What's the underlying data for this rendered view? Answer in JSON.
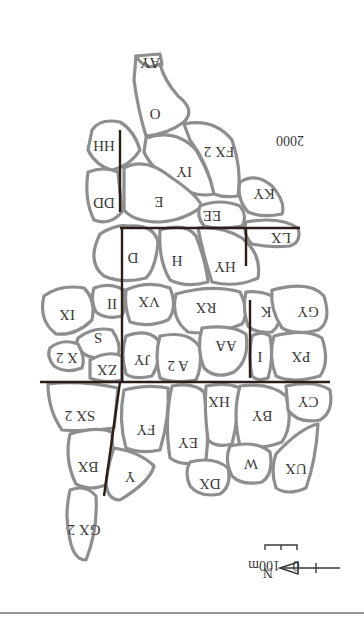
{
  "figure": {
    "orientation": "rotated-180",
    "year_label": "2000",
    "scale_bar": {
      "zero": "0",
      "distance": "100m"
    },
    "north_label": "N",
    "colors": {
      "parcel_stroke": "#8e8e8e",
      "road": "#2a1d1a",
      "text": "#3a3a3a",
      "background": "#ffffff"
    }
  },
  "parcels": [
    {
      "id": "AY",
      "label": "AY"
    },
    {
      "id": "O",
      "label": "O"
    },
    {
      "id": "HH",
      "label": "HH"
    },
    {
      "id": "IY",
      "label": "IY"
    },
    {
      "id": "FX2",
      "label": "FX 2"
    },
    {
      "id": "DD",
      "label": "DD"
    },
    {
      "id": "E",
      "label": "E"
    },
    {
      "id": "KY",
      "label": "KY"
    },
    {
      "id": "EE",
      "label": "EE"
    },
    {
      "id": "LX",
      "label": "LX"
    },
    {
      "id": "D",
      "label": "D"
    },
    {
      "id": "H",
      "label": "H"
    },
    {
      "id": "HY",
      "label": "HY"
    },
    {
      "id": "II",
      "label": "II"
    },
    {
      "id": "VX",
      "label": "VX"
    },
    {
      "id": "RX",
      "label": "RX"
    },
    {
      "id": "K",
      "label": "K"
    },
    {
      "id": "GY",
      "label": "GY"
    },
    {
      "id": "IX",
      "label": "IX"
    },
    {
      "id": "S",
      "label": "S"
    },
    {
      "id": "X2",
      "label": "X 2"
    },
    {
      "id": "ZX",
      "label": "ZX"
    },
    {
      "id": "JY",
      "label": "JY"
    },
    {
      "id": "A2",
      "label": "A 2"
    },
    {
      "id": "AA",
      "label": "AA"
    },
    {
      "id": "I",
      "label": "I"
    },
    {
      "id": "PX",
      "label": "PX"
    },
    {
      "id": "SX2",
      "label": "SX 2"
    },
    {
      "id": "FY",
      "label": "FY"
    },
    {
      "id": "EY",
      "label": "EY"
    },
    {
      "id": "HX",
      "label": "HX"
    },
    {
      "id": "BY",
      "label": "BY"
    },
    {
      "id": "CY",
      "label": "CY"
    },
    {
      "id": "BX",
      "label": "BX"
    },
    {
      "id": "Y",
      "label": "Y"
    },
    {
      "id": "DX",
      "label": "DX"
    },
    {
      "id": "W",
      "label": "W"
    },
    {
      "id": "UX",
      "label": "UX"
    },
    {
      "id": "GX2",
      "label": "GX 2"
    }
  ]
}
